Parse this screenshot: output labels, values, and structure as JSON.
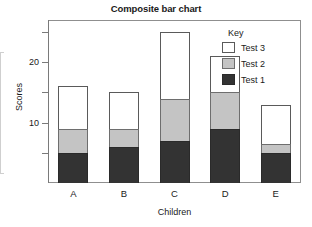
{
  "chart_data": {
    "type": "bar",
    "subtype": "stacked",
    "title": "Composite bar chart",
    "xlabel": "Children",
    "ylabel": "Scores",
    "categories": [
      "A",
      "B",
      "C",
      "D",
      "E"
    ],
    "series": [
      {
        "name": "Test 1",
        "color": "#333333",
        "values": [
          5,
          6,
          7,
          9,
          5
        ]
      },
      {
        "name": "Test 2",
        "color": "#c4c4c4",
        "values": [
          4,
          3,
          7,
          6,
          1.5
        ]
      },
      {
        "name": "Test 3",
        "color": "#ffffff",
        "values": [
          7,
          6,
          11,
          6,
          6.5
        ]
      }
    ],
    "totals": [
      16,
      15,
      25,
      21,
      13
    ],
    "ylim": [
      0,
      27
    ],
    "ytick_labels": [
      "10",
      "20"
    ],
    "ytick_values": [
      10,
      20
    ],
    "yminor_tick_values": [
      5,
      15,
      25
    ],
    "grid": false,
    "legend_position": "top-right",
    "legend_title": "Key"
  },
  "legend": {
    "title": "Key",
    "entries": [
      {
        "label": "Test 3",
        "swatch": "white"
      },
      {
        "label": "Test 2",
        "swatch": "gray"
      },
      {
        "label": "Test 1",
        "swatch": "dark"
      }
    ]
  }
}
